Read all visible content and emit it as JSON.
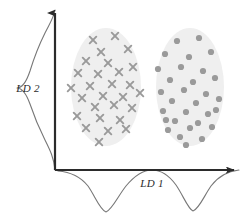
{
  "figure": {
    "background_color": "#ffffff",
    "width": 249,
    "height": 223
  },
  "axes": {
    "color": "#2b2b2b",
    "origin": {
      "x": 55,
      "y": 170
    },
    "x_axis": {
      "name": "LD 1",
      "label": "LD 1",
      "label_x": 152,
      "label_y": 187,
      "from_x": 55,
      "to_x": 241,
      "y": 170,
      "arrowhead": "right"
    },
    "y_axis": {
      "name": "LD 2",
      "label": "LD 2",
      "label_x": 28,
      "label_y": 92,
      "from_y": 170,
      "to_y": 9,
      "x": 55,
      "arrowhead": "up"
    }
  },
  "clusters": [
    {
      "id": "cluster-1",
      "name": "cross-cluster",
      "marker": "cross",
      "marker_color": "#9a9a9a",
      "ellipse_fill": "#efefef",
      "center_x": 106,
      "center_y": 87,
      "rx": 35,
      "ry": 59,
      "count": 28
    },
    {
      "id": "cluster-2",
      "name": "dot-cluster",
      "marker": "circle",
      "marker_color": "#9a9a9a",
      "ellipse_fill": "#efefef",
      "center_x": 190,
      "center_y": 87,
      "rx": 34,
      "ry": 59,
      "count": 30
    }
  ],
  "chart_data": {
    "type": "scatter",
    "xlabel": "LD 1",
    "ylabel": "LD 2",
    "grid": false,
    "legend": "none",
    "xlim": [
      55,
      241
    ],
    "ylim": [
      170,
      9
    ],
    "series": [
      {
        "name": "cross-cluster",
        "marker": "cross",
        "color": "#9a9a9a",
        "points": [
          [
            93,
            40
          ],
          [
            115,
            36
          ],
          [
            101,
            52
          ],
          [
            128,
            49
          ],
          [
            86,
            61
          ],
          [
            108,
            63
          ],
          [
            133,
            67
          ],
          [
            78,
            73
          ],
          [
            98,
            74
          ],
          [
            119,
            72
          ],
          [
            71,
            88
          ],
          [
            90,
            86
          ],
          [
            112,
            84
          ],
          [
            130,
            85
          ],
          [
            82,
            98
          ],
          [
            103,
            96
          ],
          [
            123,
            97
          ],
          [
            140,
            93
          ],
          [
            95,
            107
          ],
          [
            114,
            105
          ],
          [
            132,
            108
          ],
          [
            77,
            116
          ],
          [
            100,
            118
          ],
          [
            120,
            120
          ],
          [
            86,
            128
          ],
          [
            108,
            131
          ],
          [
            126,
            129
          ],
          [
            99,
            142
          ]
        ]
      },
      {
        "name": "dot-cluster",
        "marker": "circle",
        "color": "#9a9a9a",
        "points": [
          [
            177,
            41
          ],
          [
            199,
            38
          ],
          [
            165,
            54
          ],
          [
            189,
            57
          ],
          [
            211,
            52
          ],
          [
            158,
            69
          ],
          [
            181,
            67
          ],
          [
            203,
            71
          ],
          [
            170,
            80
          ],
          [
            193,
            82
          ],
          [
            215,
            78
          ],
          [
            161,
            92
          ],
          [
            184,
            90
          ],
          [
            206,
            94
          ],
          [
            172,
            101
          ],
          [
            196,
            103
          ],
          [
            219,
            99
          ],
          [
            163,
            111
          ],
          [
            186,
            112
          ],
          [
            208,
            114
          ],
          [
            175,
            121
          ],
          [
            198,
            123
          ],
          [
            168,
            130
          ],
          [
            190,
            128
          ],
          [
            212,
            127
          ],
          [
            180,
            137
          ],
          [
            202,
            139
          ],
          [
            186,
            145
          ],
          [
            166,
            120
          ],
          [
            216,
            110
          ]
        ]
      }
    ],
    "marginal_densities": [
      {
        "name": "ld2-marginal-density",
        "axis": "y",
        "modality": "unimodal",
        "color": "#777777",
        "peak_position": 88,
        "peak_amplitude": 40,
        "baseline_x": 55,
        "description": "Single broad peak on the LD 2 axis; classes overlap so no separation."
      },
      {
        "name": "ld1-marginal-density",
        "axis": "x",
        "modality": "bimodal",
        "color": "#777777",
        "peak_positions": [
          106,
          193
        ],
        "peak_amplitude": 44,
        "baseline_y": 170,
        "description": "Two well separated peaks on the LD 1 axis; classes separate cleanly."
      }
    ]
  }
}
